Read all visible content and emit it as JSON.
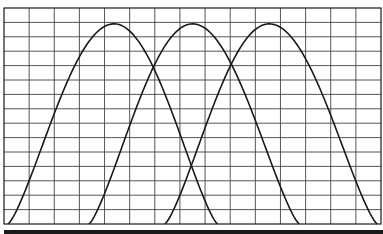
{
  "chart_data": {
    "type": "line",
    "title": "",
    "xlabel": "",
    "ylabel": "",
    "grid": true,
    "legend": null,
    "grid_columns": 15,
    "grid_rows": 15,
    "x_range": [
      0,
      15
    ],
    "y_range": [
      0,
      15
    ],
    "curve_shape": "bell (cos^1.3 half-wave), feet meet baseline",
    "series": [
      {
        "name": "curve-1",
        "left_foot": 0.16,
        "peak_x": 4.38,
        "right_foot": 8.5,
        "peak_y": 13.9
      },
      {
        "name": "curve-2",
        "left_foot": 3.38,
        "peak_x": 7.5,
        "right_foot": 11.75,
        "peak_y": 13.9
      },
      {
        "name": "curve-3",
        "left_foot": 6.4,
        "peak_x": 10.55,
        "right_foot": 14.85,
        "peak_y": 13.9
      }
    ],
    "crossings": [
      {
        "between": [
          "curve-1",
          "curve-2"
        ],
        "x": 5.97,
        "y": 10.6
      },
      {
        "between": [
          "curve-2",
          "curve-3"
        ],
        "x": 9.0,
        "y": 10.6
      }
    ]
  },
  "style": {
    "line_color": "#1a1a1a",
    "grid_color": "#444444",
    "background": "#ffffff",
    "bottom_bar_color": "#1a1a1a"
  }
}
